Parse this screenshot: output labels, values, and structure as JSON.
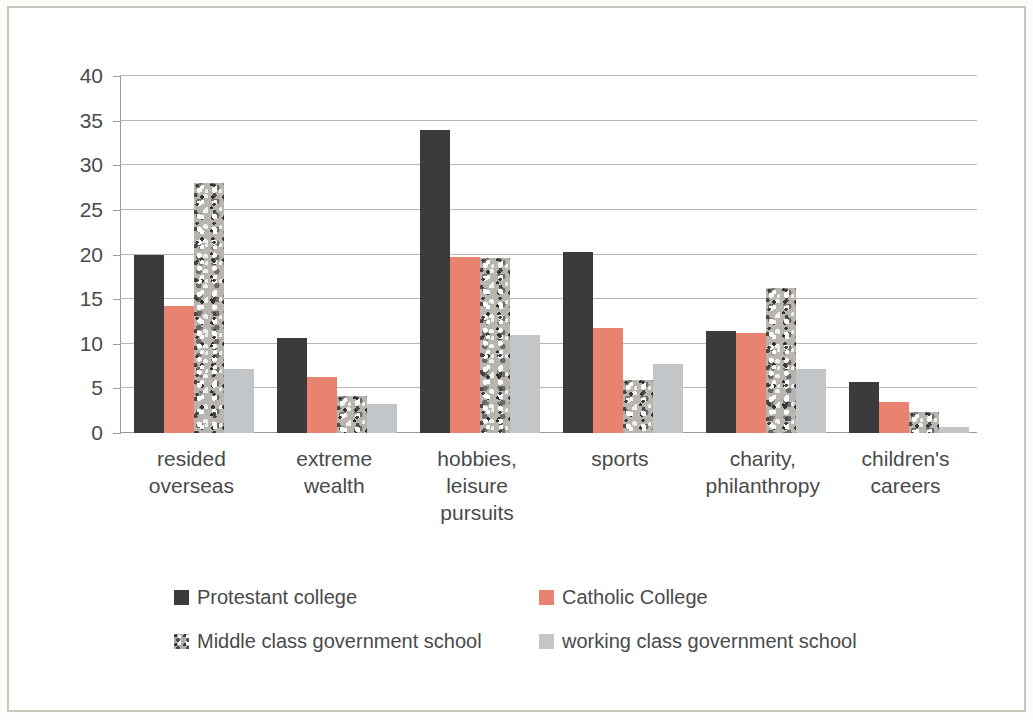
{
  "chart_data": {
    "type": "bar",
    "title": "",
    "subtitle": "",
    "xlabel": "",
    "ylabel": "",
    "ylim": [
      0,
      40
    ],
    "yticks": [
      0,
      5,
      10,
      15,
      20,
      25,
      30,
      35,
      40
    ],
    "ytick_labels": [
      "0",
      "5",
      "10",
      "15",
      "20",
      "25",
      "30",
      "35",
      "40"
    ],
    "grid": true,
    "legend_position": "bottom",
    "categories": [
      "resided overseas",
      "extreme wealth",
      "hobbies, leisure pursuits",
      "sports",
      "charity, philanthropy",
      "children's careers"
    ],
    "category_lines": [
      [
        "resided",
        "overseas"
      ],
      [
        "extreme",
        "wealth"
      ],
      [
        "hobbies,",
        "leisure",
        "pursuits"
      ],
      [
        "sports"
      ],
      [
        "charity,",
        "philanthropy"
      ],
      [
        "children's",
        "careers"
      ]
    ],
    "series": [
      {
        "name": "Protestant college",
        "color": "#3b3a3c",
        "fill": "solid",
        "values": [
          20.0,
          10.7,
          34.0,
          20.3,
          11.4,
          5.7
        ]
      },
      {
        "name": "Catholic College",
        "color": "#e8836f",
        "fill": "solid",
        "values": [
          14.2,
          6.3,
          19.7,
          11.8,
          11.2,
          3.5
        ]
      },
      {
        "name": "Middle class government school",
        "color": "#b8b5b0",
        "fill": "speckled",
        "values": [
          28.0,
          4.2,
          19.6,
          5.9,
          16.2,
          2.4
        ]
      },
      {
        "name": "working class government school",
        "color": "#c3c6c8",
        "fill": "solid",
        "values": [
          7.2,
          3.2,
          11.0,
          7.7,
          7.2,
          0.7
        ]
      }
    ]
  }
}
